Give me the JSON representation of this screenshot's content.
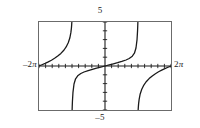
{
  "figure": {
    "kind": "graphing-calculator-plot",
    "labels": {
      "top": "5",
      "bottom": "–5",
      "left_value": "–2",
      "left_unit": "π",
      "right_value": "2",
      "right_unit": "π"
    },
    "colors": {
      "frame": "#6b6b6b",
      "axis": "#1a1a1a",
      "curve": "#1a1a1a",
      "background": "#ffffff"
    }
  },
  "chart_data": {
    "type": "line",
    "title": "",
    "subtitle": "",
    "xlabel": "",
    "ylabel": "",
    "function": "y = tan(x/2)",
    "xlim": [
      -6.283185,
      6.283185
    ],
    "ylim": [
      -5,
      5
    ],
    "xlim_labels": [
      "–2π",
      "2π"
    ],
    "ylim_labels": [
      "–5",
      "5"
    ],
    "grid": false,
    "legend": null,
    "legend_position": "none",
    "x_tick_step": 0.6283185,
    "y_tick_step": 1,
    "x_tick_count": 20,
    "y_tick_count": 10,
    "asymptotes": [
      -3.141593,
      3.141593
    ],
    "branches": [
      {
        "name": "left-branch",
        "x_range": [
          -6.283185,
          -3.141593
        ],
        "note": "rises from y=-5 clipped near x=-2π up through y≈0 at x=-2π? asymptote at x=-π",
        "points": [
          [
            -6.283185,
            -0.0
          ],
          [
            -6.0,
            0.142
          ],
          [
            -5.7,
            0.3
          ],
          [
            -5.4,
            0.47
          ],
          [
            -5.1,
            0.66
          ],
          [
            -4.8,
            0.875
          ],
          [
            -4.5,
            1.125
          ],
          [
            -4.2,
            1.428
          ],
          [
            -3.9,
            1.818
          ],
          [
            -3.7,
            2.166
          ],
          [
            -3.5,
            2.65
          ],
          [
            -3.35,
            3.179
          ],
          [
            -3.25,
            3.784
          ],
          [
            -3.2,
            4.281
          ],
          [
            -3.17,
            4.731
          ],
          [
            -3.16,
            4.936
          ],
          [
            -3.15,
            5.0
          ]
        ]
      },
      {
        "name": "center-branch",
        "x_range": [
          -3.141593,
          3.141593
        ],
        "note": "through origin, asymptotes at x=±π",
        "points": [
          [
            -3.13,
            -5.0
          ],
          [
            -3.12,
            -4.644
          ],
          [
            -3.1,
            -4.017
          ],
          [
            -3.05,
            -3.004
          ],
          [
            -2.95,
            -2.046
          ],
          [
            -2.8,
            -1.455
          ],
          [
            -2.6,
            -1.12
          ],
          [
            -2.3,
            -0.853
          ],
          [
            -2.0,
            -0.684
          ],
          [
            -1.6,
            -0.516
          ],
          [
            -1.2,
            -0.372
          ],
          [
            -0.8,
            -0.24
          ],
          [
            -0.4,
            -0.118
          ],
          [
            0.0,
            0.0
          ],
          [
            0.4,
            0.118
          ],
          [
            0.8,
            0.24
          ],
          [
            1.2,
            0.372
          ],
          [
            1.6,
            0.516
          ],
          [
            2.0,
            0.684
          ],
          [
            2.3,
            0.853
          ],
          [
            2.6,
            1.12
          ],
          [
            2.8,
            1.455
          ],
          [
            2.95,
            2.046
          ],
          [
            3.05,
            3.004
          ],
          [
            3.1,
            4.017
          ],
          [
            3.12,
            4.644
          ],
          [
            3.13,
            5.0
          ]
        ]
      },
      {
        "name": "right-branch",
        "x_range": [
          3.141593,
          6.283185
        ],
        "note": "rises from y=-5 just right of x=π to y≈0 at x=2π",
        "points": [
          [
            3.15,
            -5.0
          ],
          [
            3.16,
            -4.936
          ],
          [
            3.17,
            -4.731
          ],
          [
            3.2,
            -4.281
          ],
          [
            3.25,
            -3.784
          ],
          [
            3.35,
            -3.179
          ],
          [
            3.5,
            -2.65
          ],
          [
            3.7,
            -2.166
          ],
          [
            3.9,
            -1.818
          ],
          [
            4.2,
            -1.428
          ],
          [
            4.5,
            -1.125
          ],
          [
            4.8,
            -0.875
          ],
          [
            5.1,
            -0.66
          ],
          [
            5.4,
            -0.47
          ],
          [
            5.7,
            -0.3
          ],
          [
            6.0,
            -0.142
          ],
          [
            6.283185,
            0.0
          ]
        ]
      }
    ]
  }
}
